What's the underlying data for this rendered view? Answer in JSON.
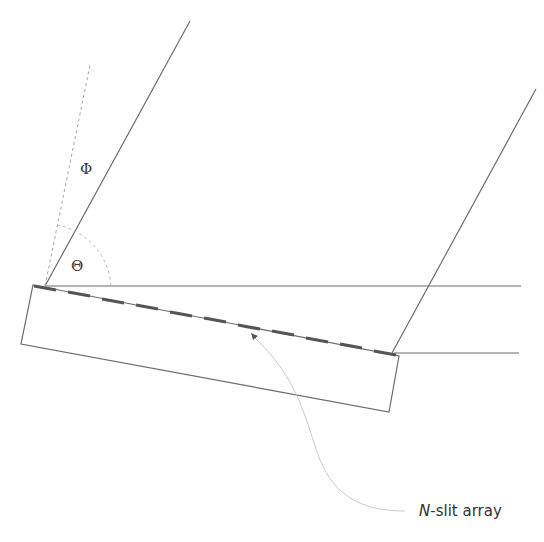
{
  "labels": {
    "phi": "Φ",
    "theta": "Θ",
    "caption_italic": "N",
    "caption_rest": "-slit array"
  },
  "colors": {
    "line": "#6b6b6b",
    "dashed": "#9a9a9a",
    "slit": "#555555",
    "arc": "#b0b0b0"
  }
}
